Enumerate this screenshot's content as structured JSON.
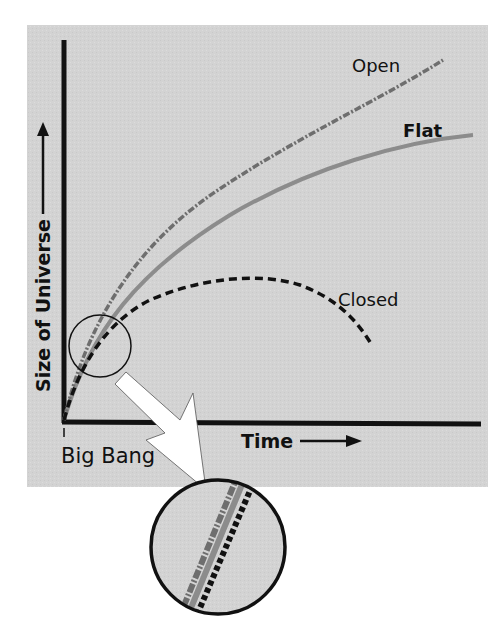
{
  "diagram": {
    "title": "",
    "background_color": "#ffffff",
    "panel_color": "#d3d3d3",
    "axes": {
      "y_label": "Size of Universe",
      "x_label": "Time",
      "origin_label": "Big Bang",
      "axis_color": "#111111"
    },
    "curves": [
      {
        "name": "Open",
        "label": "Open",
        "style": "dash-dot",
        "color": "#6e6e6e"
      },
      {
        "name": "Flat",
        "label": "Flat",
        "style": "solid",
        "color": "#8c8c8c"
      },
      {
        "name": "Closed",
        "label": "Closed",
        "style": "dashed",
        "color": "#111111"
      }
    ],
    "inset": {
      "description": "Magnified view of the early-time region where all three curves overlap",
      "source_circle": "small circle near origin",
      "target_circle": "large magnified circle below panel",
      "arrow_color": "#ffffff"
    }
  }
}
